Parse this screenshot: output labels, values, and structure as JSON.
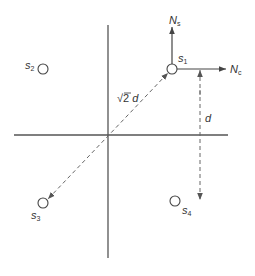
{
  "diagram": {
    "type": "constellation",
    "colors": {
      "axis": "#555555",
      "dashed": "#666666",
      "circle": "#444444",
      "text": "#333333"
    },
    "axes": {
      "horizontal": {
        "x1": 14,
        "x2": 228,
        "y": 135
      },
      "vertical": {
        "x": 108,
        "y1": 25,
        "y2": 258
      }
    },
    "points": [
      {
        "id": "s1",
        "label": "s",
        "subscript": "1",
        "cx": 172,
        "cy": 69
      },
      {
        "id": "s2",
        "label": "s",
        "subscript": "2",
        "cx": 43,
        "cy": 69
      },
      {
        "id": "s3",
        "label": "s",
        "subscript": "3",
        "cx": 43,
        "cy": 203
      },
      {
        "id": "s4",
        "label": "s",
        "subscript": "4",
        "cx": 175,
        "cy": 201
      }
    ],
    "noise_vectors": [
      {
        "id": "Ns",
        "label": "N",
        "subscript": "s",
        "direction": "up"
      },
      {
        "id": "Nc",
        "label": "N",
        "subscript": "c",
        "direction": "right"
      }
    ],
    "distances": [
      {
        "id": "diagonal",
        "label_prefix": "√2",
        "label_var": "d",
        "from": "s1",
        "to": "s3",
        "style": "dashed"
      },
      {
        "id": "vertical",
        "label_var": "d",
        "from": "s1-level",
        "to": "s4-level",
        "style": "dashed"
      }
    ]
  },
  "labels": {
    "s1": {
      "base": "s",
      "sub": "1"
    },
    "s2": {
      "base": "s",
      "sub": "2"
    },
    "s3": {
      "base": "s",
      "sub": "3"
    },
    "s4": {
      "base": "s",
      "sub": "4"
    },
    "ns": {
      "base": "N",
      "sub": "s"
    },
    "nc": {
      "base": "N",
      "sub": "c"
    },
    "diag_dist": {
      "root": "√2",
      "var": "d"
    },
    "vert_dist": {
      "var": "d"
    }
  }
}
